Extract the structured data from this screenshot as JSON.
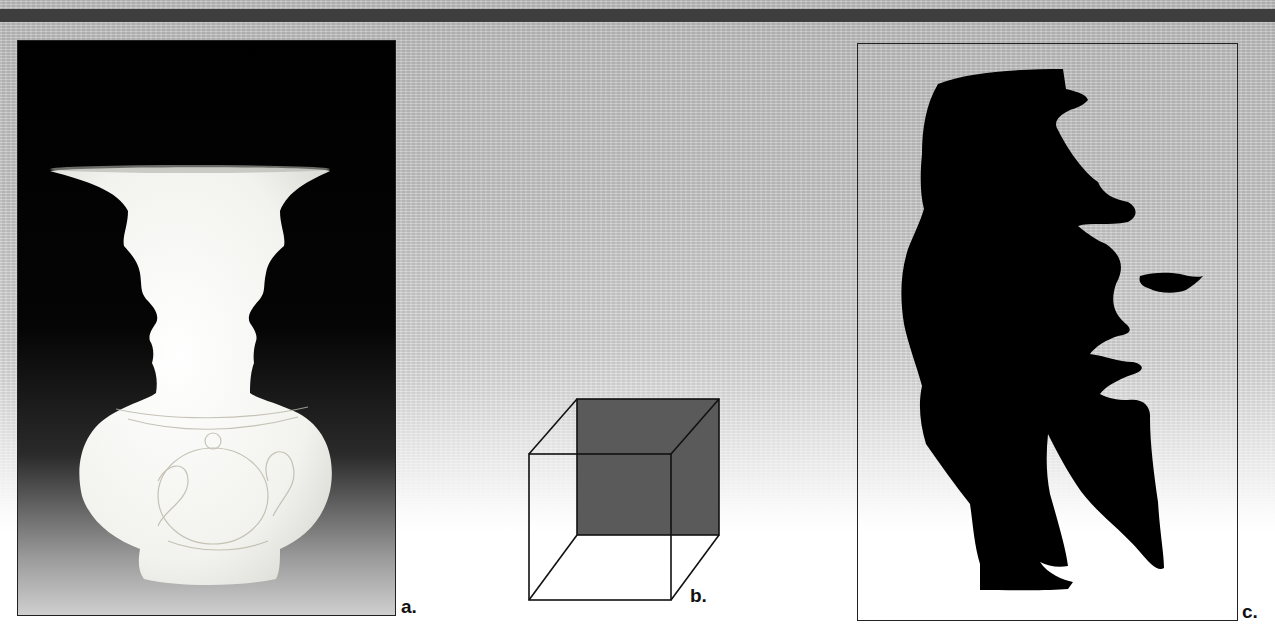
{
  "figure": {
    "panels": [
      {
        "id": "a",
        "label": "a.",
        "subject": "Rubin vase / two faces profile illusion"
      },
      {
        "id": "b",
        "label": "b.",
        "subject": "Necker cube with shaded back face"
      },
      {
        "id": "c",
        "label": "c.",
        "subject": "Saxophonist silhouette / woman's face illusion"
      }
    ]
  },
  "colors": {
    "topbar": "#3e3e3e",
    "panel_border": "#222222",
    "cube_face": "#555555",
    "silhouette": "#000000",
    "vase": "#f4f4f1"
  }
}
